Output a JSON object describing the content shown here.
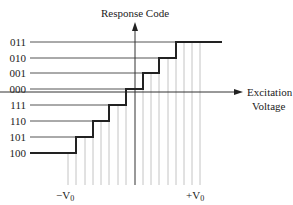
{
  "diagram": {
    "y_axis_label": "Response Code",
    "x_axis_label_line1": "Excitation",
    "x_axis_label_line2": "Voltage",
    "neg_label": "−V",
    "neg_sub": "0",
    "pos_label": "+V",
    "pos_sub": "0",
    "codes": [
      "011",
      "010",
      "001",
      "000",
      "111",
      "110",
      "101",
      "100"
    ],
    "colors": {
      "line": "#222222",
      "grid": "#bbbbbb",
      "level": "#555555"
    }
  }
}
